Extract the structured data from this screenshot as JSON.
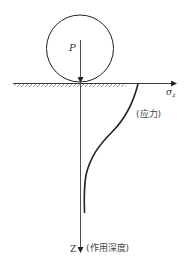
{
  "diagram": {
    "type": "stress-depth diagram",
    "load_label": "P",
    "stress_axis_label_main": "σ",
    "stress_axis_label_sub": "z",
    "curve_label": "(应力)",
    "depth_axis_label": "Z",
    "depth_axis_desc": "(作用深度)",
    "colors": {
      "line": "#222222",
      "hatch": "#888888",
      "text": "#333333"
    }
  }
}
